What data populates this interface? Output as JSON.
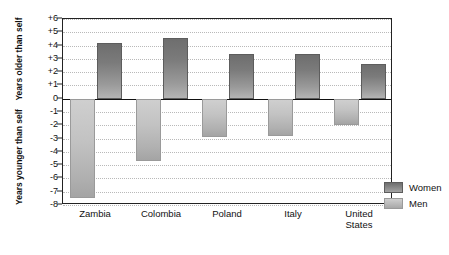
{
  "chart_data": {
    "type": "bar",
    "title": "",
    "subtitle": "",
    "xlabel": "",
    "ylabel_upper": "Years older than self",
    "ylabel_lower": "Years younger than self",
    "categories": [
      "Zambia",
      "Colombia",
      "Poland",
      "Italy",
      "United States"
    ],
    "category_lines": [
      [
        "Zambia"
      ],
      [
        "Colombia"
      ],
      [
        "Poland"
      ],
      [
        "Italy"
      ],
      [
        "United",
        "States"
      ]
    ],
    "series": [
      {
        "name": "Men",
        "values": [
          -7.5,
          -4.7,
          -2.9,
          -2.8,
          -2.0
        ]
      },
      {
        "name": "Women",
        "values": [
          4.2,
          4.6,
          3.4,
          3.4,
          2.6
        ]
      }
    ],
    "ylim": [
      -8,
      6
    ],
    "ytick_values": [
      6,
      5,
      4,
      3,
      2,
      1,
      0,
      -1,
      -2,
      -3,
      -4,
      -5,
      -6,
      -7,
      -8
    ],
    "ytick_labels": [
      "+6",
      "+5",
      "+4",
      "+3",
      "+2",
      "+1",
      "0",
      "-1",
      "-2",
      "-3",
      "-4",
      "-5",
      "-6",
      "-7",
      "-8"
    ],
    "grid": true,
    "grid_style": "dotted",
    "zero_line": true,
    "legend_position": "right",
    "colors": {
      "women": "#7b7b7b",
      "men": "#c3c3c3",
      "grid": "#b9b9b9",
      "axis": "#222222",
      "text": "#111111",
      "background": "#ffffff"
    }
  },
  "legend": {
    "items": [
      {
        "label": "Women",
        "key": "women"
      },
      {
        "label": "Men",
        "key": "men"
      }
    ]
  }
}
